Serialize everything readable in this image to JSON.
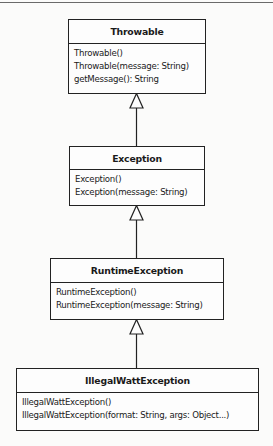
{
  "diagram": {
    "type": "UML class diagram (inheritance hierarchy)",
    "classes": [
      {
        "name": "Throwable",
        "operations": [
          "Throwable()",
          "Throwable(message: String)",
          "getMessage(): String"
        ]
      },
      {
        "name": "Exception",
        "operations": [
          "Exception()",
          "Exception(message: String)"
        ]
      },
      {
        "name": "RuntimeException",
        "operations": [
          "RuntimeException()",
          "RuntimeException(message: String)"
        ]
      },
      {
        "name": "IllegalWattException",
        "operations": [
          "IllegalWattException()",
          "IllegalWattException(format: String, args: Object...)"
        ]
      }
    ],
    "relationships": [
      {
        "type": "generalization",
        "from": "Exception",
        "to": "Throwable"
      },
      {
        "type": "generalization",
        "from": "RuntimeException",
        "to": "Exception"
      },
      {
        "type": "generalization",
        "from": "IllegalWattException",
        "to": "RuntimeException"
      }
    ],
    "colors": {
      "line": "#222222",
      "box_fill": "#fdfdfd",
      "background": "#fbfbfa"
    }
  }
}
